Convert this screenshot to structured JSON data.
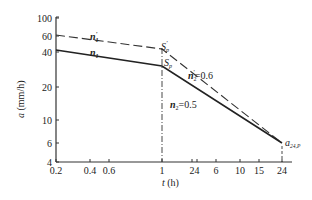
{
  "chart_data": {
    "type": "line",
    "title": "",
    "xlabel": "t (h)",
    "ylabel": "a (mm/h)",
    "xscale": "log",
    "yscale": "log",
    "xlim": [
      0.2,
      24
    ],
    "ylim": [
      4,
      100
    ],
    "grid": false,
    "x_ticks": [
      "0.2",
      "0.4",
      "0.6",
      "1",
      "2",
      "4",
      "6",
      "10",
      "15",
      "24"
    ],
    "y_ticks": [
      "4",
      "6",
      "10",
      "20",
      "40",
      "60",
      "100"
    ],
    "series": [
      {
        "name": "solid (n1, n2=0.5)",
        "style": "solid",
        "x": [
          0.2,
          1,
          24
        ],
        "y": [
          44,
          31,
          6
        ],
        "segment_labels": [
          "n1",
          "n2=0.5"
        ]
      },
      {
        "name": "dashed (n1', n2'=0.6)",
        "style": "dashed",
        "x": [
          0.2,
          1,
          24
        ],
        "y": [
          62,
          43,
          6
        ],
        "segment_labels": [
          "n1'",
          "n2'=0.6"
        ]
      }
    ],
    "annotations": [
      {
        "text": "n1'",
        "near": "dashed line, first segment"
      },
      {
        "text": "n1",
        "near": "solid line, first segment"
      },
      {
        "text": "Sp'",
        "at": [
          1,
          43
        ]
      },
      {
        "text": "Sp",
        "at": [
          1,
          31
        ]
      },
      {
        "text": "n2'=0.6",
        "near": "dashed line, second segment"
      },
      {
        "text": "n2=0.5",
        "near": "solid line, second segment"
      },
      {
        "text": "a24,P",
        "at": [
          24,
          6
        ]
      }
    ],
    "reference_lines": [
      {
        "type": "vertical",
        "x": 1,
        "style": "dash-dot"
      },
      {
        "type": "vertical",
        "x": 24,
        "style": "dashed",
        "from_y": 4,
        "to_y": 6
      }
    ]
  },
  "labels": {
    "xlabel_italic": "t",
    "xlabel_unit": " (h)",
    "ylabel_italic": "a",
    "ylabel_unit": " (mm/h)",
    "n1p": "n",
    "n1p_sub": "1",
    "n1p_sup": "'",
    "n1": "n",
    "n1_sub": "1",
    "spp": "S",
    "spp_sub": "p",
    "spp_sup": "'",
    "sp": "S",
    "sp_sub": "p",
    "n2p": "n",
    "n2p_sub": "2",
    "n2p_sup": "'",
    "n2p_val": "=0.6",
    "n2": "n",
    "n2_sub": "2",
    "n2_val": "=0.5",
    "a24": "a",
    "a24_sub": "24,P"
  },
  "ticks": {
    "x": [
      {
        "label": "0.2",
        "px": 56
      },
      {
        "label": "0.4",
        "px": 89
      },
      {
        "label": "0.6",
        "px": 109
      },
      {
        "label": "1",
        "px": 133
      },
      {
        "label": "2",
        "px": 164
      },
      {
        "label": "4",
        "px": 197
      },
      {
        "label": "6",
        "px": 216
      },
      {
        "label": "10",
        "px": 240
      },
      {
        "label": "15",
        "px": 259
      },
      {
        "label": "24",
        "px": 282
      }
    ],
    "y": [
      {
        "label": "100",
        "py": 18
      },
      {
        "label": "60",
        "py": 36
      },
      {
        "label": "40",
        "py": 52
      },
      {
        "label": "20",
        "py": 87
      },
      {
        "label": "10",
        "py": 120
      },
      {
        "label": "6",
        "py": 143
      },
      {
        "label": "4",
        "py": 162
      }
    ]
  }
}
